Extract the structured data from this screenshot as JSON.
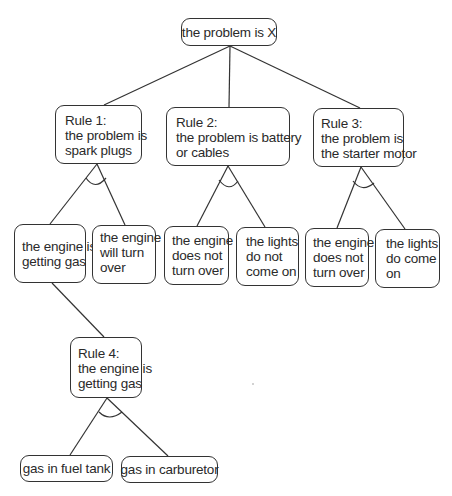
{
  "diagram": {
    "type": "and-or goal tree",
    "root": {
      "id": "root",
      "lines": [
        "the problem is X"
      ]
    },
    "rules": [
      {
        "id": "rule1",
        "lines": [
          "Rule 1:",
          "the problem is",
          "spark plugs"
        ],
        "and_link": true,
        "children": [
          {
            "id": "r1c1",
            "lines": [
              "the engine is",
              "getting gas"
            ]
          },
          {
            "id": "r1c2",
            "lines": [
              "the engine",
              "will turn",
              "over"
            ]
          }
        ]
      },
      {
        "id": "rule2",
        "lines": [
          "Rule 2:",
          "the problem is battery",
          "or cables"
        ],
        "and_link": true,
        "children": [
          {
            "id": "r2c1",
            "lines": [
              "the engine",
              "does not",
              "turn over"
            ]
          },
          {
            "id": "r2c2",
            "lines": [
              "the lights",
              "do not",
              "come on"
            ]
          }
        ]
      },
      {
        "id": "rule3",
        "lines": [
          "Rule 3:",
          "the problem is",
          "the starter motor"
        ],
        "and_link": true,
        "children": [
          {
            "id": "r3c1",
            "lines": [
              "the engine",
              "does not",
              "turn over"
            ]
          },
          {
            "id": "r3c2",
            "lines": [
              "the lights",
              "do come",
              "on"
            ]
          }
        ]
      },
      {
        "id": "rule4",
        "parent": "r1c1",
        "lines": [
          "Rule 4:",
          "the engine is",
          "getting gas"
        ],
        "and_link": true,
        "children": [
          {
            "id": "r4c1",
            "lines": [
              "gas in fuel tank"
            ]
          },
          {
            "id": "r4c2",
            "lines": [
              "gas in carburetor"
            ]
          }
        ]
      }
    ]
  },
  "colors": {
    "line": "#333333",
    "text": "#2a2a2a",
    "background": "#ffffff"
  }
}
